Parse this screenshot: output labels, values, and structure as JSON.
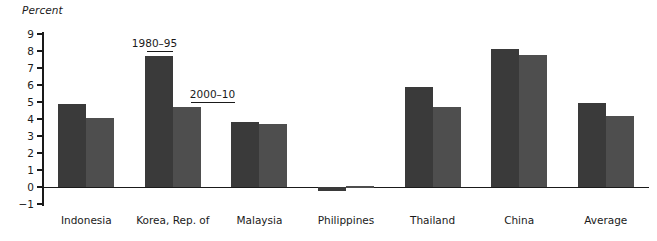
{
  "chart_data": {
    "type": "bar",
    "title": "",
    "subtitle": "",
    "xlabel": "",
    "ylabel": "Percent",
    "ylim": [
      -1,
      9
    ],
    "yticks": [
      9,
      8,
      7,
      6,
      5,
      4,
      3,
      2,
      1,
      0,
      -1
    ],
    "ytick_labels": [
      "9",
      "8",
      "7",
      "6",
      "5",
      "4",
      "3",
      "2",
      "1",
      "0",
      "−1"
    ],
    "grid": false,
    "legend_position": "annotated-inline",
    "categories": [
      "Indonesia",
      "Korea, Rep. of",
      "Malaysia",
      "Philippines",
      "Thailand",
      "China",
      "Average"
    ],
    "series": [
      {
        "name": "1980–95",
        "color": "#3a3a3a",
        "values": [
          4.9,
          7.7,
          3.85,
          -0.25,
          5.9,
          8.1,
          4.95
        ]
      },
      {
        "name": "2000–10",
        "color": "#4e4e4e",
        "values": [
          4.05,
          4.7,
          3.7,
          0.05,
          4.7,
          7.75,
          4.2
        ]
      }
    ],
    "annotations": [
      {
        "text": "1980–95",
        "points_to": {
          "category": "Korea, Rep. of",
          "series": "1980–95"
        }
      },
      {
        "text": "2000–10",
        "points_to": {
          "category": "Korea, Rep. of",
          "series": "2000–10"
        }
      }
    ]
  },
  "colors": {
    "series_1980_95": "#3a3a3a",
    "series_2000_10": "#4e4e4e",
    "axis": "#1a1a1a",
    "background": "#ffffff"
  }
}
